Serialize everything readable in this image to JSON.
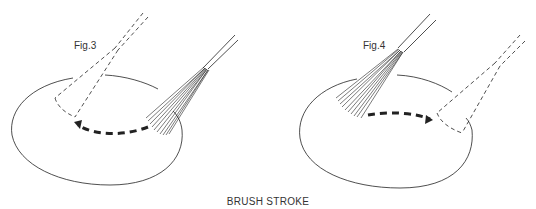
{
  "figures": [
    {
      "id": "fig3",
      "label": "Fig.3",
      "stroke_direction": "right-to-left"
    },
    {
      "id": "fig4",
      "label": "Fig.4",
      "stroke_direction": "left-to-right"
    }
  ],
  "caption": "BRUSH STROKE",
  "colors": {
    "line": "#222222",
    "background": "#ffffff"
  }
}
